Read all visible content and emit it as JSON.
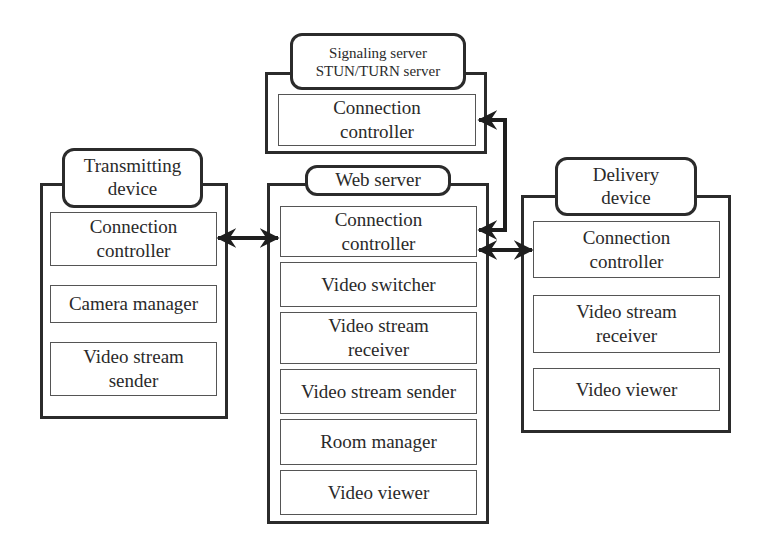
{
  "signaling_server": {
    "title_line1": "Signaling server",
    "title_line2": "STUN/TURN server",
    "components": [
      "Connection controller"
    ]
  },
  "transmitting_device": {
    "title_line1": "Transmitting",
    "title_line2": "device",
    "components": [
      "Connection controller",
      "Camera manager",
      "Video stream sender"
    ]
  },
  "web_server": {
    "title": "Web server",
    "components": [
      "Connection controller",
      "Video switcher",
      "Video stream receiver",
      "Video stream sender",
      "Room manager",
      "Video viewer"
    ]
  },
  "delivery_device": {
    "title_line1": "Delivery",
    "title_line2": "device",
    "components": [
      "Connection controller",
      "Video stream receiver",
      "Video viewer"
    ]
  },
  "connections": [
    {
      "from": "transmitting_device.connection_controller",
      "to": "web_server.connection_controller",
      "type": "bidirectional"
    },
    {
      "from": "web_server.connection_controller",
      "to": "signaling_server.connection_controller",
      "type": "bidirectional"
    },
    {
      "from": "web_server.connection_controller",
      "to": "delivery_device.connection_controller",
      "type": "bidirectional"
    }
  ],
  "colors": {
    "stroke": "#2b2b2b",
    "background": "#ffffff"
  }
}
